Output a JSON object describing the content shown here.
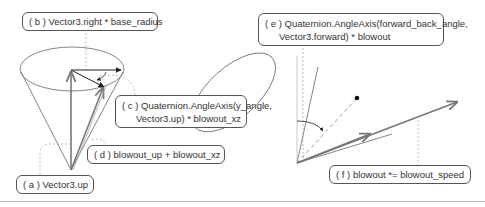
{
  "diagram": {
    "left_panel": {
      "labels": {
        "a": "( a ) Vector3.up",
        "b": "( b ) Vector3.right * base_radius",
        "c_line1": "( c ) Quaternion.AngleAxis(y_angle,",
        "c_line2": "Vector3.up) * blowout_xz",
        "d": "( d ) blowout_up + blowout_xz"
      }
    },
    "right_panel": {
      "labels": {
        "e_line1": "( e ) Quaternion.AngleAxis(forward_back_angle,",
        "e_line2": "Vector3.forward) * blowout",
        "f": "( f ) blowout *= blowout_speed"
      }
    },
    "colors": {
      "line": "#555555",
      "arrow_dark": "#222222",
      "arrow_gray": "#777777",
      "leader": "#aaaaaa",
      "rule": "#bdbdbd"
    }
  }
}
